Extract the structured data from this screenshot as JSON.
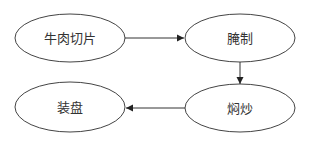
{
  "diagram": {
    "type": "flowchart",
    "nodes": [
      {
        "id": "n1",
        "label": "牛肉切片",
        "cx": 70,
        "cy": 38,
        "rx": 55,
        "ry": 24
      },
      {
        "id": "n2",
        "label": "腌制",
        "cx": 240,
        "cy": 38,
        "rx": 55,
        "ry": 24
      },
      {
        "id": "n3",
        "label": "焖炒",
        "cx": 240,
        "cy": 108,
        "rx": 55,
        "ry": 24
      },
      {
        "id": "n4",
        "label": "装盘",
        "cx": 70,
        "cy": 107,
        "rx": 55,
        "ry": 25
      }
    ],
    "edges": [
      {
        "from": "牛肉切片",
        "to": "腌制"
      },
      {
        "from": "腌制",
        "to": "焖炒"
      },
      {
        "from": "焖炒",
        "to": "装盘"
      }
    ],
    "colors": {
      "stroke": "#333333",
      "background": "#ffffff"
    }
  }
}
